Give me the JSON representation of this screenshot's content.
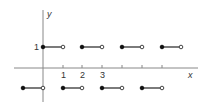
{
  "diagram": {
    "type": "step-function-plot",
    "axes": {
      "x_label": "x",
      "y_label": "y",
      "x_tick_labels": [
        "1",
        "2",
        "3"
      ],
      "y_tick_labels": [
        "1"
      ]
    },
    "segments": [
      {
        "x_start": 0,
        "x_end": 1,
        "y": 1,
        "start": "closed",
        "end": "open"
      },
      {
        "x_start": 2,
        "x_end": 3,
        "y": 1,
        "start": "closed",
        "end": "open"
      },
      {
        "x_start": 4,
        "x_end": 5,
        "y": 1,
        "start": "closed",
        "end": "open"
      },
      {
        "x_start": 6,
        "x_end": 7,
        "y": 1,
        "start": "closed",
        "end": "open"
      },
      {
        "x_start": -1,
        "x_end": 0,
        "y": -1,
        "start": "closed",
        "end": "open"
      },
      {
        "x_start": 1,
        "x_end": 2,
        "y": -1,
        "start": "closed",
        "end": "open"
      },
      {
        "x_start": 3,
        "x_end": 4,
        "y": -1,
        "start": "closed",
        "end": "open"
      },
      {
        "x_start": 5,
        "x_end": 6,
        "y": -1,
        "start": "closed",
        "end": "open"
      }
    ]
  }
}
